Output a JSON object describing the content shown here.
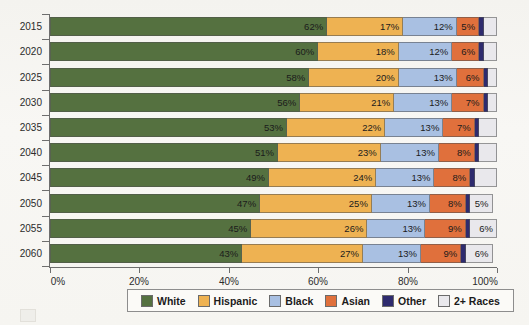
{
  "chart_data": {
    "type": "bar",
    "orientation": "horizontal",
    "stacked": true,
    "title": "",
    "xlabel": "",
    "ylabel": "",
    "xlim": [
      0,
      100
    ],
    "grid": false,
    "legend_position": "bottom",
    "categories": [
      "2015",
      "2020",
      "2025",
      "2030",
      "2035",
      "2040",
      "2045",
      "2050",
      "2055",
      "2060"
    ],
    "xticks": [
      "0%",
      "20%",
      "40%",
      "60%",
      "80%",
      "100%"
    ],
    "xtick_values": [
      0,
      20,
      40,
      60,
      80,
      100
    ],
    "series": [
      {
        "name": "White",
        "color": "#557140",
        "values": [
          62,
          60,
          58,
          56,
          53,
          51,
          49,
          47,
          45,
          43
        ]
      },
      {
        "name": "Hispanic",
        "color": "#eeb252",
        "values": [
          17,
          18,
          20,
          21,
          22,
          23,
          24,
          25,
          26,
          27
        ]
      },
      {
        "name": "Black",
        "color": "#a9c0e2",
        "values": [
          12,
          12,
          13,
          13,
          13,
          13,
          13,
          13,
          13,
          13
        ]
      },
      {
        "name": "Asian",
        "color": "#e0703c",
        "values": [
          5,
          6,
          6,
          7,
          7,
          8,
          8,
          8,
          9,
          9
        ]
      },
      {
        "name": "Other",
        "color": "#2e2b6e",
        "values": [
          1,
          1,
          1,
          1,
          1,
          1,
          1,
          1,
          1,
          1
        ]
      },
      {
        "name": "2+ Races",
        "color": "#e9e8ec",
        "values": [
          3,
          3,
          2,
          2,
          4,
          4,
          5,
          5,
          6,
          6
        ]
      }
    ],
    "data_labels": [
      [
        "62%",
        "17%",
        "12%",
        "5%",
        "",
        ""
      ],
      [
        "60%",
        "18%",
        "12%",
        "6%",
        "",
        ""
      ],
      [
        "58%",
        "20%",
        "13%",
        "6%",
        "",
        ""
      ],
      [
        "56%",
        "21%",
        "13%",
        "7%",
        "",
        ""
      ],
      [
        "53%",
        "22%",
        "13%",
        "7%",
        "",
        ""
      ],
      [
        "51%",
        "23%",
        "13%",
        "8%",
        "",
        ""
      ],
      [
        "49%",
        "24%",
        "13%",
        "8%",
        "",
        ""
      ],
      [
        "47%",
        "25%",
        "13%",
        "8%",
        "",
        "5%"
      ],
      [
        "45%",
        "26%",
        "13%",
        "9%",
        "",
        "6%"
      ],
      [
        "43%",
        "27%",
        "13%",
        "9%",
        "",
        "6%"
      ]
    ]
  },
  "legend": {
    "items": [
      {
        "label": "White",
        "color": "#557140"
      },
      {
        "label": "Hispanic",
        "color": "#eeb252"
      },
      {
        "label": "Black",
        "color": "#a9c0e2"
      },
      {
        "label": "Asian",
        "color": "#e0703c"
      },
      {
        "label": "Other",
        "color": "#2e2b6e"
      },
      {
        "label": "2+ Races",
        "color": "#e9e8ec"
      }
    ]
  },
  "colors": {
    "axis": "#6e6e6e",
    "text": "#2b2b2b",
    "page_background": "#f7f6f2",
    "legend_border": "#8d8d8d"
  }
}
